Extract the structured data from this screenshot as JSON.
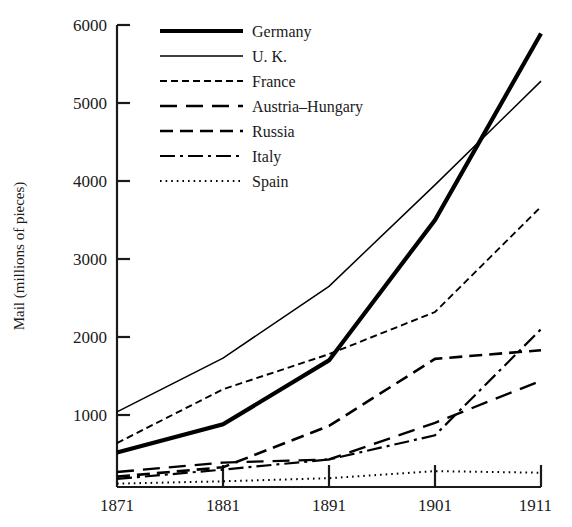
{
  "chart_data": {
    "type": "line",
    "title": "",
    "subtitle": "",
    "xlabel": "",
    "ylabel": "Mail (millions of pieces)",
    "x": [
      1871,
      1881,
      1891,
      1901,
      1911
    ],
    "xticklabels": [
      "1871",
      "1881",
      "1891",
      "1901",
      "1911"
    ],
    "yticks": [
      1000,
      2000,
      3000,
      4000,
      5000,
      6000
    ],
    "yticklabels": [
      "1000",
      "2000",
      "3000",
      "4000",
      "5000",
      "6000"
    ],
    "xlim": [
      1871,
      1911
    ],
    "ylim": [
      0,
      6200
    ],
    "grid": false,
    "legend_position": "upper-left-inside",
    "axis_color": "#1a1a1a",
    "series": [
      {
        "name": "Germany",
        "style": "solid-thick",
        "color": "#000000",
        "values": [
          520,
          880,
          1700,
          3500,
          5890
        ]
      },
      {
        "name": "U. K.",
        "style": "solid-thin",
        "color": "#000000",
        "values": [
          1040,
          1730,
          2650,
          3950,
          5280
        ]
      },
      {
        "name": "France",
        "style": "dotted-short-dash",
        "color": "#000000",
        "values": [
          640,
          1330,
          1780,
          2320,
          3670
        ]
      },
      {
        "name": "Austria–Hungary",
        "style": "long-dash",
        "color": "#000000",
        "values": [
          270,
          390,
          430,
          900,
          1440
        ]
      },
      {
        "name": "Russia",
        "style": "medium-dash",
        "color": "#000000",
        "values": [
          210,
          330,
          860,
          1720,
          1830
        ]
      },
      {
        "name": "Italy",
        "style": "dash-dot",
        "color": "#000000",
        "values": [
          180,
          300,
          430,
          740,
          2100
        ]
      },
      {
        "name": "Spain",
        "style": "fine-dotted",
        "color": "#000000",
        "values": [
          120,
          150,
          190,
          280,
          260
        ]
      }
    ]
  },
  "legend": {
    "entries": [
      {
        "label": "Germany"
      },
      {
        "label": "U. K."
      },
      {
        "label": "France"
      },
      {
        "label": "Austria–Hungary"
      },
      {
        "label": "Russia"
      },
      {
        "label": "Italy"
      },
      {
        "label": "Spain"
      }
    ]
  }
}
